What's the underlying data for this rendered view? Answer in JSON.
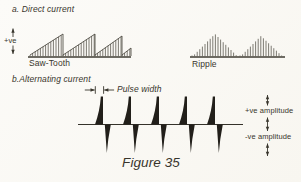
{
  "page": {
    "bg": "#fbfaf6",
    "ink": "#38352c"
  },
  "section_a": {
    "heading": "a. Direct current",
    "axis_label": "+ve",
    "sawtooth_label": "Saw-Tooth",
    "ripple_label": "Ripple"
  },
  "section_b": {
    "heading": "b.Alternating current",
    "pulse_width_label": "Pulse width",
    "pos_amplitude_label": "+ve amplitude",
    "neg_amplitude_label": "-ve amplitude"
  },
  "caption": "Figure 35",
  "waveforms": {
    "sawtooth": {
      "type": "sawtooth-dc",
      "baseline_y": 57,
      "x0": 28,
      "x1": 131,
      "bar_step": 2.6,
      "bar_color": "#6f6d64",
      "line_color": "#3f3c33",
      "ramps": [
        {
          "x0": 30,
          "x1": 63,
          "peak": 23
        },
        {
          "x0": 63,
          "x1": 95,
          "peak": 23
        },
        {
          "x0": 95,
          "x1": 122,
          "peak": 21
        },
        {
          "x0": 122,
          "x1": 131,
          "peak": 9
        }
      ]
    },
    "ripple": {
      "type": "ripple-dc",
      "baseline_y": 57,
      "x0": 190,
      "x1": 285,
      "bar_step": 2.6,
      "bar_color": "#6f6d64",
      "line_color": "#3f3c33",
      "humps": [
        {
          "x0": 192,
          "xc": 215,
          "x1": 238,
          "peak": 23
        },
        {
          "x0": 240,
          "xc": 261,
          "x1": 283,
          "peak": 21
        }
      ]
    },
    "pulse_train": {
      "type": "alternating-pulses",
      "baseline_y": 124.5,
      "x0": 78,
      "x1": 243,
      "top_y": 96.5,
      "bottom_y": 153,
      "upper_width": 8,
      "lower_width": 6,
      "pulse_x": [
        103,
        131,
        159,
        187,
        215
      ],
      "color": "#221f1a",
      "line_color": "#35322a"
    },
    "annotation_geometry": {
      "pulse_width_ticks_x": [
        95.3,
        103.6
      ],
      "pulse_width_y": 90,
      "amp_arrows_x": 267.5,
      "amp_arrow_spans": [
        [
          95,
          105.5
        ],
        [
          117.5,
          131
        ],
        [
          143.5,
          156
        ]
      ],
      "axis_arrow_x": 13,
      "axis_arrow_up": [
        37,
        28.5
      ],
      "axis_arrow_down": [
        45.5,
        54
      ]
    }
  }
}
